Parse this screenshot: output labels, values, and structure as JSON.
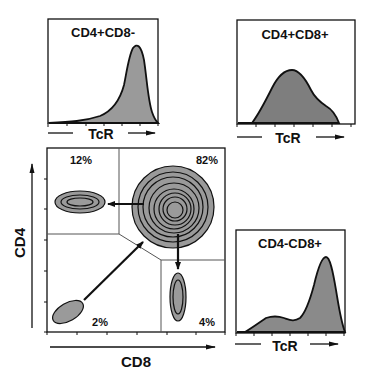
{
  "figure": {
    "type": "flow-cytometry-schematic",
    "colors": {
      "fill": "#9a9a9a",
      "line": "#111111",
      "gate": "#555555",
      "background": "#ffffff"
    }
  },
  "histograms": [
    {
      "id": "cd4-cd8neg",
      "title": "CD4+CD8-",
      "xlabel": "TcR",
      "shape": "single high peak near right"
    },
    {
      "id": "cd4-cd8pos",
      "title": "CD4+CD8+",
      "xlabel": "TcR",
      "shape": "broad intermediate peak with right shoulder"
    },
    {
      "id": "cd4neg-cd8pos",
      "title": "CD4-CD8+",
      "xlabel": "TcR",
      "shape": "small low hump then high peak near right"
    }
  ],
  "dotplot": {
    "xlabel": "CD8",
    "ylabel": "CD4",
    "quadrants": {
      "top_left": {
        "label": "12%",
        "population": "CD4+CD8-"
      },
      "top_right": {
        "label": "82%",
        "population": "CD4+CD8+"
      },
      "bottom_left": {
        "label": "2%",
        "population": "CD4-CD8-"
      },
      "bottom_right": {
        "label": "4%",
        "population": "CD4-CD8+"
      }
    },
    "arrows": [
      {
        "from": "bottom_left",
        "to": "top_right"
      },
      {
        "from": "top_right",
        "to": "top_left"
      },
      {
        "from": "top_right",
        "to": "bottom_right"
      }
    ]
  }
}
